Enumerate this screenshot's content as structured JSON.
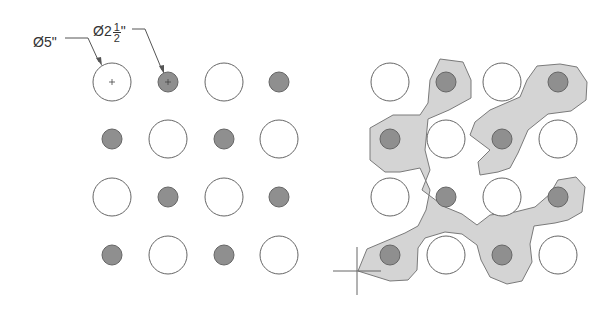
{
  "labels": {
    "large_hole": "Ø5\"",
    "small_hole_prefix": "Ø2",
    "small_hole_frac_num": "1",
    "small_hole_frac_den": "2",
    "small_hole_suffix": "\""
  },
  "colors": {
    "stroke": "#666666",
    "small_fill": "#8f8f8f",
    "region_fill": "#d4d4d4",
    "region_stroke": "#7a7a7a",
    "large_fill": "#ffffff",
    "line": "#555555"
  },
  "grid": {
    "rows_y": [
      82,
      139,
      197,
      255
    ],
    "left_cols_x": [
      112,
      168,
      224,
      279
    ],
    "right_cols_x": [
      390,
      446,
      502,
      558
    ],
    "large_radius": 19,
    "small_radius": 10,
    "pattern": [
      [
        "L",
        "S",
        "L",
        "S"
      ],
      [
        "S",
        "L",
        "S",
        "L"
      ],
      [
        "L",
        "S",
        "L",
        "S"
      ],
      [
        "S",
        "L",
        "S",
        "L"
      ]
    ]
  },
  "crosshair": {
    "x": 357,
    "y": 271
  }
}
